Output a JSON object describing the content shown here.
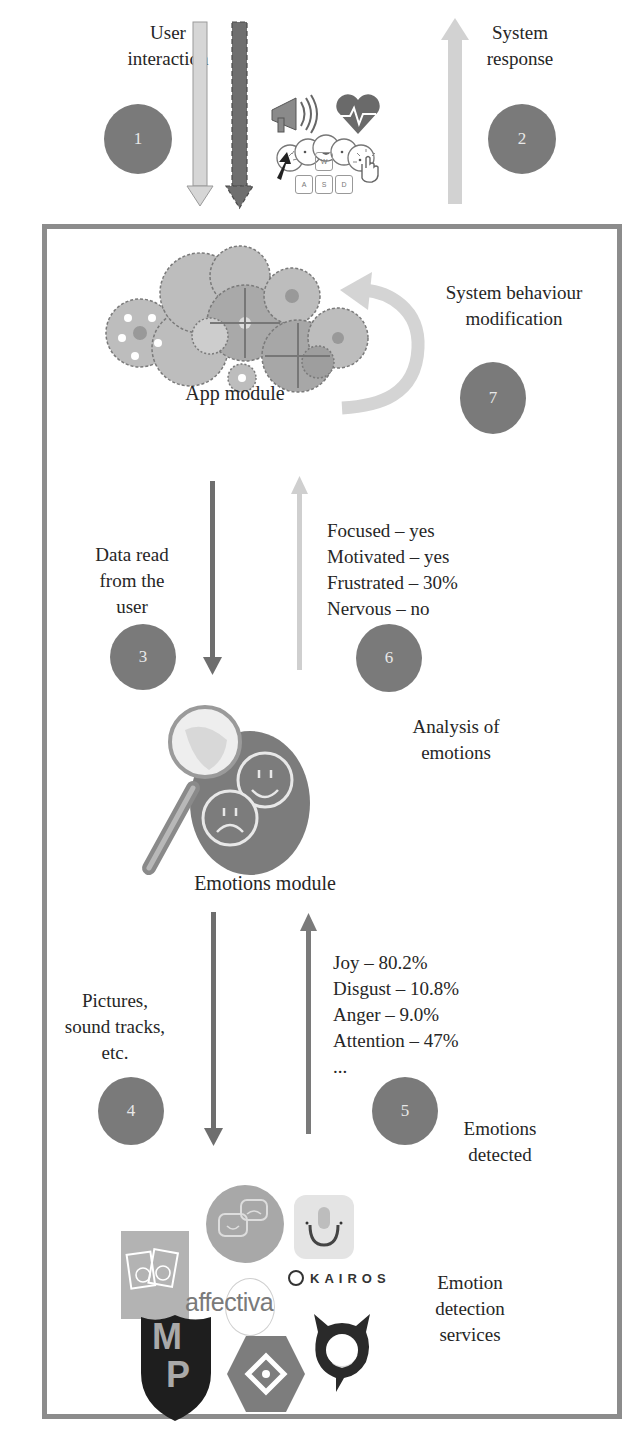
{
  "top": {
    "user_interaction": {
      "line1": "User",
      "line2": "interaction"
    },
    "system_response": {
      "line1": "System",
      "line2": "response"
    },
    "steps": {
      "s1": "1",
      "s2": "2"
    },
    "input_icons": [
      "megaphone-icon",
      "heart-rate-icon",
      "emoji-faces-icon",
      "mouse-cursor-icon",
      "keyboard-wasd-icon",
      "touch-hand-icon"
    ],
    "keys": {
      "w": "W",
      "a": "A",
      "s": "S",
      "d": "D"
    }
  },
  "app_module": {
    "label": "App module",
    "icon": "gears-cloud-icon",
    "behaviour": {
      "line1": "System behaviour",
      "line2": "modification"
    },
    "step": "7"
  },
  "read": {
    "label": {
      "line1": "Data read",
      "line2": "from the",
      "line3": "user"
    },
    "step": "3"
  },
  "analysis": {
    "results": [
      "Focused – yes",
      "Motivated – yes",
      "Frustrated – 30%",
      "Nervous – no"
    ],
    "step": "6",
    "label": {
      "line1": "Analysis of",
      "line2": "emotions"
    }
  },
  "emotions_module": {
    "label": "Emotions module",
    "icon": "magnifier-faces-icon"
  },
  "media": {
    "label": {
      "line1": "Pictures,",
      "line2": "sound tracks,",
      "line3": "etc."
    },
    "step": "4"
  },
  "detected": {
    "results": [
      "Joy – 80.2%",
      "Disgust – 10.8%",
      "Anger – 9.0%",
      "Attention – 47%",
      "..."
    ],
    "step": "5",
    "label": {
      "line1": "Emotions",
      "line2": "detected"
    }
  },
  "services": {
    "label": {
      "line1": "Emotion",
      "line2": "detection",
      "line3": "services"
    },
    "logos": {
      "kairos": "KAIROS",
      "affectiva": "affectiva",
      "mp_m": "M",
      "mp_p": "P"
    }
  },
  "colors": {
    "circle": "#7a7a7a",
    "frame": "#8c8c8c",
    "arrow_dark": "#6e6e6e",
    "arrow_light": "#cfcfcf"
  }
}
